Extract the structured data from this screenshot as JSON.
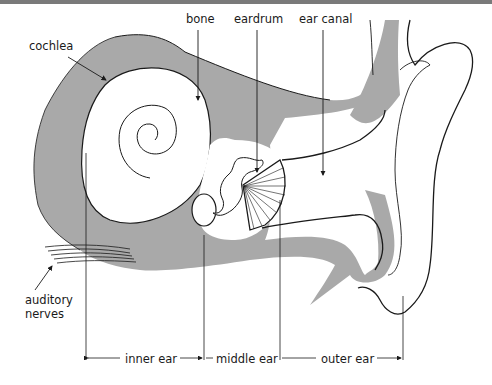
{
  "diagram": {
    "labels": {
      "bone": "bone",
      "eardrum": "eardrum",
      "ear_canal": "ear canal",
      "cochlea": "cochlea",
      "auditory_nerves_line1": "auditory",
      "auditory_nerves_line2": "nerves",
      "inner_ear": "inner ear",
      "middle_ear": "middle ear",
      "outer_ear": "outer ear"
    },
    "colors": {
      "tissue_gray": "#a9a9a9",
      "outline": "#1a1a1a",
      "background": "#ffffff",
      "top_bar": "#7a7a7a"
    }
  }
}
